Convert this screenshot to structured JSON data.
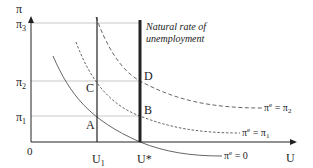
{
  "diagram": {
    "y_axis_label": "π",
    "x_axis_label": "U",
    "origin_label": "0",
    "y_ticks": [
      {
        "label": "π",
        "sub": "3",
        "name": "pi3"
      },
      {
        "label": "π",
        "sub": "2",
        "name": "pi2"
      },
      {
        "label": "π",
        "sub": "1",
        "name": "pi1"
      }
    ],
    "x_ticks": [
      {
        "label": "U",
        "sub": "1",
        "name": "u1"
      },
      {
        "label": "U*",
        "sub": "",
        "name": "ustar"
      }
    ],
    "natural_rate_label_line1": "Natural rate of",
    "natural_rate_label_line2": "unemployment",
    "points": [
      "A",
      "B",
      "C",
      "D"
    ],
    "curves": [
      {
        "label": "π",
        "sup": "e",
        "rhs": " = 0",
        "style": "solid"
      },
      {
        "label": "π",
        "sup": "e",
        "rhs": " = π",
        "rhs_sub": "1",
        "style": "short-dash"
      },
      {
        "label": "π",
        "sup": "e",
        "rhs": " = π",
        "rhs_sub": "2",
        "style": "long-dash"
      }
    ]
  }
}
